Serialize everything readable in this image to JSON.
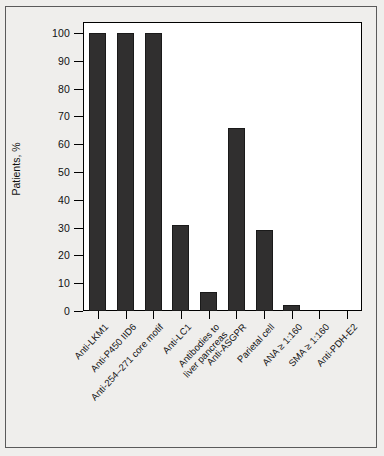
{
  "chart_data": {
    "type": "bar",
    "title": "",
    "xlabel": "",
    "ylabel": "Patients, %",
    "ylim": [
      0,
      100
    ],
    "yticks": [
      0,
      10,
      20,
      30,
      40,
      50,
      60,
      70,
      80,
      90,
      100
    ],
    "grid": false,
    "legend": false,
    "bar_color": "#302f2f",
    "plot_background": "#ffffff",
    "figure_background": "#efeeec",
    "categories": [
      "Anti-LKM1",
      "Anti-P450 IID6",
      "Anti-254–271 core motif",
      "Anti-LC1",
      "Antibodies to liver pancreas",
      "Anti-ASGPR",
      "Parietal cell",
      "ANA ≥ 1:160",
      "SMA ≥ 1:160",
      "Anti-PDH-E2"
    ],
    "category_lines": [
      [
        "Anti-LKM1"
      ],
      [
        "Anti-P450 IID6"
      ],
      [
        "Anti-254–271 core motif"
      ],
      [
        "Anti-LC1"
      ],
      [
        "Antibodies to",
        "liver pancreas"
      ],
      [
        "Anti-ASGPR"
      ],
      [
        "Parietal cell"
      ],
      [
        "ANA ≥ 1:160"
      ],
      [
        "SMA ≥ 1:160"
      ],
      [
        "Anti-PDH-E2"
      ]
    ],
    "values": [
      100,
      100,
      100,
      31,
      7,
      66,
      29,
      2,
      0,
      0
    ]
  }
}
